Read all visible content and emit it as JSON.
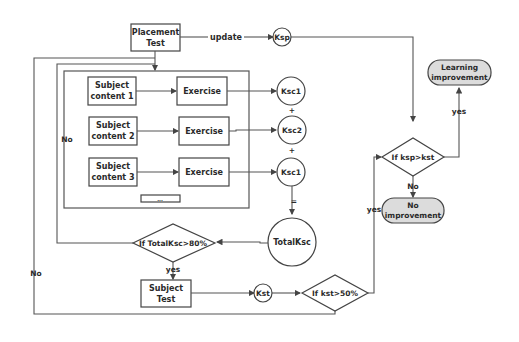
{
  "nodes": {
    "placement_test": {
      "line1": "Placement",
      "line2": "Test"
    },
    "update_label": "update",
    "ksp": "Ksp",
    "subjects": [
      {
        "line1": "Subject",
        "line2": "content 1",
        "exercise": "Exercise",
        "score": "Ksc1"
      },
      {
        "line1": "Subject",
        "line2": "content 2",
        "exercise": "Exercise",
        "score": "Ksc2"
      },
      {
        "line1": "Subject",
        "line2": "content 3",
        "exercise": "Exercise",
        "score": "Ksc1"
      }
    ],
    "ellipsis": "...",
    "plus1": "+",
    "plus2": "+",
    "equals": "=",
    "total_ksc": "TotalKsc",
    "decision_total": "If TotalKsc>80%",
    "subject_test": {
      "line1": "Subject",
      "line2": "Test"
    },
    "kst": "Kst",
    "decision_kst": "If kst>50%",
    "decision_ksp": "If ksp>kst",
    "learning_improvement": {
      "line1": "Learning",
      "line2": "improvement"
    },
    "no_improvement": {
      "line1": "No",
      "line2": "improvement"
    }
  },
  "edge_labels": {
    "no_inner": "No",
    "no_outer": "No",
    "yes_total": "yes",
    "yes_kst": "yes",
    "yes_ksp": "yes",
    "no_ksp": "No"
  },
  "colors": {
    "line": "#555555",
    "terminal_fill": "#dcdcdc",
    "box_fill": "#ffffff"
  }
}
